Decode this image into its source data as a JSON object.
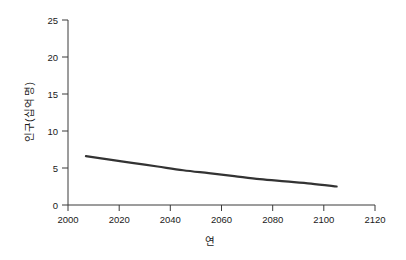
{
  "chart_data": {
    "type": "line",
    "title": "",
    "subtitle": "",
    "xlabel": "연",
    "ylabel": "인구(십억 명)",
    "xlim": [
      2000,
      2120
    ],
    "ylim": [
      0,
      25
    ],
    "grid": false,
    "legend": false,
    "legend_position": "none",
    "x_ticks": [
      2000,
      2020,
      2040,
      2060,
      2080,
      2100,
      2120
    ],
    "x_tick_labels": [
      "2000",
      "2020",
      "2040",
      "2060",
      "2080",
      "2100",
      "2120"
    ],
    "y_ticks": [
      0,
      5,
      10,
      15,
      20,
      25
    ],
    "y_tick_labels": [
      "0",
      "5",
      "10",
      "15",
      "20",
      "25"
    ],
    "series": [
      {
        "name": "인구",
        "color": "#333333",
        "line_width": 2.2,
        "x": [
          2007,
          2015,
          2025,
          2035,
          2045,
          2055,
          2065,
          2075,
          2085,
          2095,
          2105
        ],
        "values": [
          6.6,
          6.2,
          5.7,
          5.2,
          4.7,
          4.3,
          3.9,
          3.5,
          3.2,
          2.9,
          2.5
        ]
      }
    ],
    "annotations": []
  },
  "figure": {
    "background_color": "#ffffff",
    "axis_color": "#3a3a3a",
    "text_color": "#1a1a1a",
    "accent_color": "#333333"
  }
}
